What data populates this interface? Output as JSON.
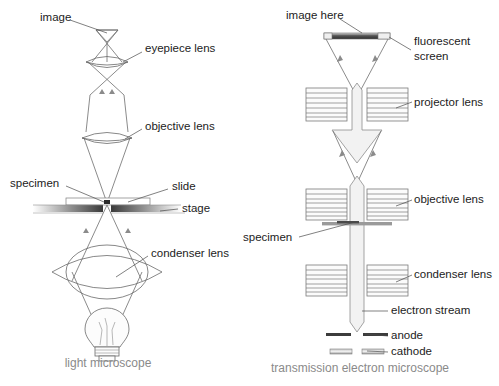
{
  "figure": {
    "background_color": "#ffffff",
    "line_color": "#6d6d6d",
    "label_color": "#1c1c1c",
    "caption_color": "#8a8a8a"
  },
  "left_diagram": {
    "caption": "light microscope",
    "labels": {
      "image": "image",
      "eyepiece_lens": "eyepiece lens",
      "objective_lens": "objective lens",
      "specimen": "specimen",
      "slide": "slide",
      "stage": "stage",
      "condenser_lens": "condenser lens"
    },
    "components": [
      "image",
      "eyepiece lens",
      "objective lens",
      "specimen",
      "slide",
      "stage",
      "condenser lens",
      "light bulb"
    ]
  },
  "right_diagram": {
    "caption": "transmission electron microscope",
    "labels": {
      "image_here": "image here",
      "fluorescent_screen_line1": "fluorescent",
      "fluorescent_screen_line2": "screen",
      "projector_lens": "projector lens",
      "objective_lens": "objective lens",
      "specimen": "specimen",
      "condenser_lens": "condenser lens",
      "electron_stream": "electron stream",
      "anode": "anode",
      "cathode": "cathode"
    },
    "components": [
      "image here",
      "fluorescent screen",
      "projector lens",
      "objective lens",
      "specimen",
      "condenser lens",
      "electron stream",
      "anode",
      "cathode"
    ]
  }
}
